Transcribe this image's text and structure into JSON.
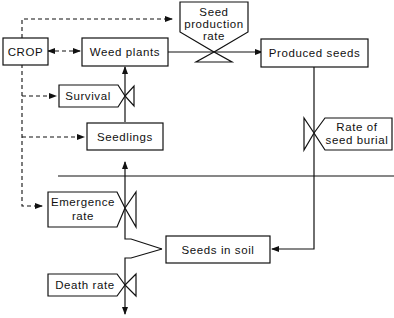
{
  "diagram": {
    "title": "",
    "nodes": {
      "crop": "CROP",
      "weed_plants": "Weed plants",
      "seed_production_rate": [
        "Seed",
        "production",
        "rate"
      ],
      "produced_seeds": "Produced seeds",
      "survival": "Survival",
      "seedlings": "Seedlings",
      "rate_of_seed_burial": [
        "Rate of",
        "seed burial"
      ],
      "emergence_rate": [
        "Emergence",
        "rate"
      ],
      "seeds_in_soil": "Seeds in soil",
      "death_rate": "Death rate"
    },
    "edges": [
      {
        "from": "CROP",
        "to": "Weed plants",
        "style": "dashed",
        "bidirectional": true
      },
      {
        "from": "CROP",
        "to": "Seed production rate",
        "style": "dashed"
      },
      {
        "from": "CROP",
        "to": "Survival",
        "style": "dashed"
      },
      {
        "from": "CROP",
        "to": "Seedlings",
        "style": "dashed"
      },
      {
        "from": "CROP",
        "to": "Emergence rate",
        "style": "dashed"
      },
      {
        "from": "Weed plants",
        "to": "Produced seeds",
        "style": "solid",
        "via": "Seed production rate"
      },
      {
        "from": "Produced seeds",
        "to": "Seeds in soil",
        "style": "solid",
        "via": "Rate of seed burial"
      },
      {
        "from": "Seeds in soil",
        "to": "Seedlings",
        "style": "solid",
        "via": "Emergence rate"
      },
      {
        "from": "Seedlings",
        "to": "Weed plants",
        "style": "solid",
        "via": "Survival"
      },
      {
        "from": "Seeds in soil",
        "to": "out",
        "style": "solid",
        "via": "Death rate"
      }
    ],
    "separator": "soil surface line"
  }
}
